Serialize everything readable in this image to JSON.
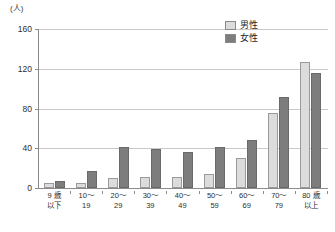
{
  "chart_data": {
    "type": "bar",
    "title": "",
    "xlabel": "",
    "ylabel": "(人)",
    "unit_label": "(人)",
    "ylim": [
      0,
      160
    ],
    "yticks": [
      0,
      40,
      80,
      120,
      160
    ],
    "ytick_labels": [
      "0",
      "40",
      "80",
      "120",
      "160"
    ],
    "grid": true,
    "grid_axis": "y",
    "legend_position": "top-right",
    "categories": [
      "9歳以下",
      "10〜19",
      "20〜29",
      "30〜39",
      "40〜49",
      "50〜59",
      "60〜69",
      "70〜79",
      "80歳以上"
    ],
    "category_lines": [
      [
        "9 歳",
        "以下"
      ],
      [
        "10〜",
        "19"
      ],
      [
        "20〜",
        "29"
      ],
      [
        "30〜",
        "39"
      ],
      [
        "40〜",
        "49"
      ],
      [
        "50〜",
        "59"
      ],
      [
        "60〜",
        "69"
      ],
      [
        "70〜",
        "79"
      ],
      [
        "80 歳",
        "以上"
      ]
    ],
    "series": [
      {
        "name": "男性",
        "color": "#dcdcdc",
        "values": [
          5,
          5,
          10,
          11,
          11,
          14,
          30,
          75,
          127
        ]
      },
      {
        "name": "女性",
        "color": "#7d7d7d",
        "values": [
          7,
          17,
          41,
          39,
          36,
          41,
          48,
          92,
          116
        ]
      }
    ]
  },
  "legend": {
    "items": [
      {
        "label": "男性",
        "swatch": "male"
      },
      {
        "label": "女性",
        "swatch": "female"
      }
    ]
  },
  "colors": {
    "male_fill": "#dcdcdc",
    "female_fill": "#7d7d7d",
    "axis": "#8a8a8a",
    "grid": "#c9c9c9",
    "text": "#2e2e2e"
  }
}
